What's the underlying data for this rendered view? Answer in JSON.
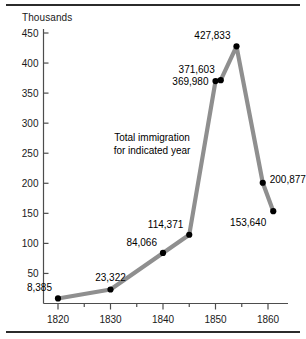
{
  "figure": {
    "y_axis_unit_label": "Thousands",
    "annotation": {
      "line1": "Total immigration",
      "line2": "for indicated year"
    }
  },
  "chart_data": {
    "type": "line",
    "title": "",
    "subtitle": "",
    "xlabel": "",
    "ylabel": "Thousands",
    "xlim": [
      1817,
      1863
    ],
    "ylim": [
      0,
      450
    ],
    "grid": false,
    "legend": null,
    "line_color": "#8f8f8f",
    "marker_color": "#000000",
    "x_ticks": [
      1820,
      1830,
      1840,
      1850,
      1860
    ],
    "x_tick_labels": [
      "1820",
      "1830",
      "1840",
      "1850",
      "1860"
    ],
    "x_minor_ticks": [
      1825,
      1835,
      1845,
      1855
    ],
    "y_ticks": [
      50,
      100,
      150,
      200,
      250,
      300,
      350,
      400,
      450
    ],
    "y_tick_labels": [
      "50",
      "100",
      "150",
      "200",
      "250",
      "300",
      "350",
      "400",
      "450"
    ],
    "units": "thousands",
    "points": [
      {
        "x": 1820,
        "y": 8.385,
        "label": "8,385",
        "label_pos": "left-above"
      },
      {
        "x": 1830,
        "y": 23.322,
        "label": "23,322",
        "label_pos": "above"
      },
      {
        "x": 1840,
        "y": 84.066,
        "label": "84,066",
        "label_pos": "above-left"
      },
      {
        "x": 1845,
        "y": 114.371,
        "label": "114,371",
        "label_pos": "above-left"
      },
      {
        "x": 1850,
        "y": 369.98,
        "label": "369,980",
        "label_pos": "left"
      },
      {
        "x": 1851,
        "y": 371.603,
        "label": "371,603",
        "label_pos": "above-left"
      },
      {
        "x": 1854,
        "y": 427.833,
        "label": "427,833",
        "label_pos": "above-left"
      },
      {
        "x": 1859,
        "y": 200.877,
        "label": "200,877",
        "label_pos": "right"
      },
      {
        "x": 1861,
        "y": 153.64,
        "label": "153,640",
        "label_pos": "below-left"
      }
    ]
  }
}
